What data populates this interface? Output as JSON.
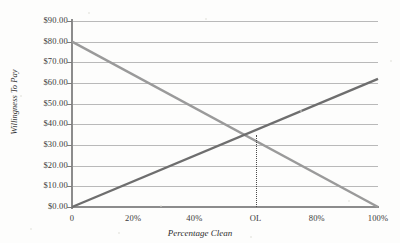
{
  "chart_data": {
    "type": "line",
    "title": "",
    "xlabel": "Percentage Clean",
    "ylabel": "Willingness To Pay",
    "xlim": [
      0,
      100
    ],
    "ylim": [
      0,
      90
    ],
    "grid": true,
    "legend": null,
    "ytick_labels": [
      "$90.00",
      "$80.00",
      "$70.00",
      "$60.00",
      "$50.00",
      "$40.00",
      "$30.00",
      "$20.00",
      "$10.00",
      "$0.00"
    ],
    "ytick_values": [
      90,
      80,
      70,
      60,
      50,
      40,
      30,
      20,
      10,
      0
    ],
    "xtick_labels": [
      "0",
      "20%",
      "40%",
      "OL",
      "80%",
      "100%"
    ],
    "xtick_values": [
      0,
      20,
      40,
      60,
      80,
      100
    ],
    "series": [
      {
        "name": "marginal-benefit",
        "direction": "descending",
        "color": "#9a9a9a",
        "x": [
          0,
          100
        ],
        "values": [
          80,
          0
        ]
      },
      {
        "name": "marginal-cost",
        "direction": "ascending",
        "color": "#6e6e6e",
        "x": [
          0,
          100
        ],
        "values": [
          0,
          62
        ]
      }
    ],
    "annotations": [
      {
        "name": "optimal-level",
        "label": "OL",
        "x": 60,
        "y": 35,
        "style": "dotted-vertical-droplines"
      }
    ]
  },
  "colors": {
    "background": "#fdfdfc",
    "gridline": "#b9b9b9",
    "axis": "#8c8c8c",
    "text": "#3a3a3a",
    "descending_line": "#9a9a9a",
    "ascending_line": "#6e6e6e",
    "dotted_line": "#4a4a4a"
  }
}
